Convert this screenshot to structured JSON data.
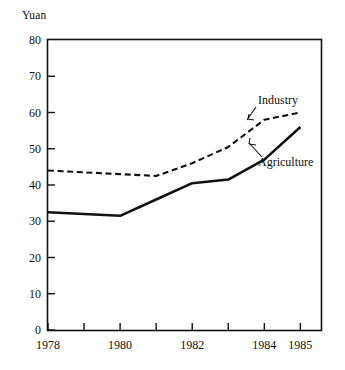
{
  "axis_title": "Yuan",
  "chart_data": {
    "type": "line",
    "title": "",
    "subtitle": "",
    "xlabel": "",
    "ylabel": "Yuan",
    "x": [
      1978,
      1979,
      1980,
      1981,
      1982,
      1983,
      1984,
      1985
    ],
    "categories": [
      "1978",
      "1979",
      "1980",
      "1981",
      "1982",
      "1983",
      "1984",
      "1985"
    ],
    "xtick_labels": [
      "1978",
      "",
      "1980",
      "",
      "1982",
      "",
      "1984",
      "1985"
    ],
    "ytick_labels": [
      "0",
      "10",
      "20",
      "30",
      "40",
      "50",
      "60",
      "70",
      "80"
    ],
    "yticks": [
      0,
      10,
      20,
      30,
      40,
      50,
      60,
      70,
      80
    ],
    "ylim": [
      0,
      80
    ],
    "xlim": [
      1978,
      1985.6
    ],
    "grid": false,
    "legend": "inline-annotations",
    "series": [
      {
        "name": "Industry",
        "style": "dashed",
        "color": "#111111",
        "values": [
          44.0,
          43.5,
          43.0,
          42.5,
          46.0,
          50.5,
          58.0,
          60.0
        ]
      },
      {
        "name": "Agriculture",
        "style": "solid",
        "color": "#111111",
        "values": [
          32.5,
          32.0,
          31.5,
          36.0,
          40.5,
          41.5,
          47.0,
          56.0
        ]
      }
    ],
    "annotations": [
      {
        "text": "Industry",
        "series": "Industry"
      },
      {
        "text": "Agriculture",
        "series": "Agriculture"
      }
    ]
  }
}
